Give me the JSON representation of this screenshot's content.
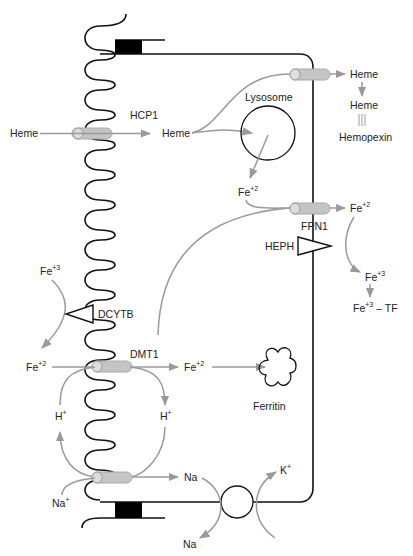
{
  "diagram": {
    "labels": {
      "hcp1": "HCP1",
      "heme_lumen": "Heme",
      "heme_cyto": "Heme",
      "lysosome": "Lysosome",
      "heme_out": "Heme",
      "heme_bound": "Heme",
      "hemopexin": "Hemopexin",
      "fe_lyso": "Fe",
      "fe_lyso_charge": "+2",
      "fe_out": "Fe",
      "fe_out_charge": "+2",
      "fpn1": "FPN1",
      "heph": "HEPH",
      "fe3_out": "Fe",
      "fe3_out_charge": "+3",
      "fe3_tf": "Fe",
      "fe3_tf_charge": "+3",
      "tf_suffix": "– TF",
      "fe3_lumen": "Fe",
      "fe3_lumen_charge": "+3",
      "dcytb": "DCYTB",
      "fe2_lumen": "Fe",
      "fe2_lumen_charge": "+2",
      "dmt1": "DMT1",
      "fe2_cyto": "Fe",
      "fe2_cyto_charge": "+2",
      "ferritin": "Ferritin",
      "h_left": "H",
      "h_left_charge": "+",
      "h_right": "H",
      "h_right_charge": "+",
      "na_lumen": "Na",
      "na_lumen_charge": "+",
      "na_cyto": "Na",
      "k_out": "K",
      "k_out_charge": "+",
      "na_out": "Na"
    },
    "colors": {
      "membrane": "#111111",
      "arrow": "#9a9a9a",
      "transporter": "#c4c4c4",
      "junction": "#000000"
    }
  }
}
